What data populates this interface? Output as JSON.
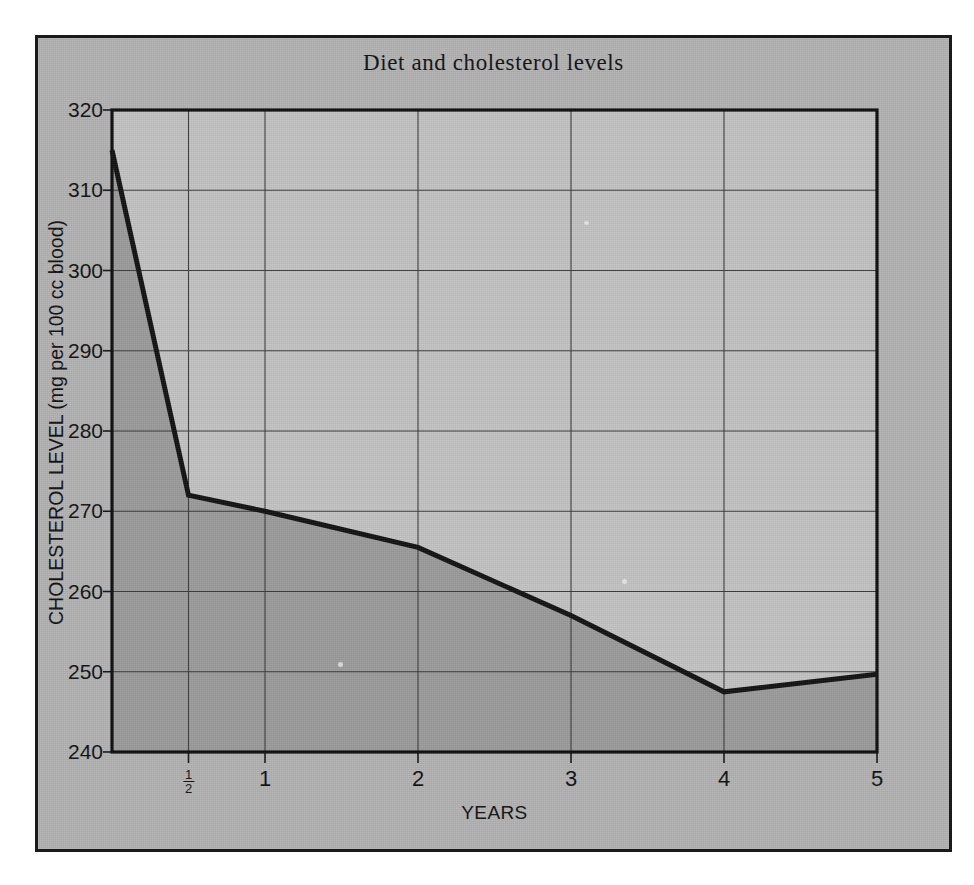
{
  "figure": {
    "title": "Diet and cholesterol levels",
    "panel_color": "#b2b2b2",
    "border_color": "#1a1a1a",
    "fill_below_color": "#9b9b9b",
    "fill_above_color": "#c3c3c3",
    "line_color": "#121212",
    "grid_color": "#3b3b3b"
  },
  "chart_data": {
    "type": "line",
    "title": "Diet and cholesterol levels",
    "xlabel": "YEARS",
    "ylabel": "CHOLESTEROL LEVEL (mg per 100 cc blood)",
    "xlim": [
      0,
      5
    ],
    "ylim": [
      240,
      320
    ],
    "grid": true,
    "legend": "none",
    "filled_area": true,
    "x_tick_values": [
      0.5,
      1,
      2,
      3,
      4,
      5
    ],
    "x_tick_labels": [
      "1/2",
      "1",
      "2",
      "3",
      "4",
      "5"
    ],
    "y_tick_values": [
      240,
      250,
      260,
      270,
      280,
      290,
      300,
      310,
      320
    ],
    "y_tick_labels": [
      "240",
      "250",
      "260",
      "270",
      "280",
      "290",
      "300",
      "310",
      "320"
    ],
    "series": [
      {
        "name": "Cholesterol level",
        "x": [
          0,
          0.5,
          1,
          2,
          3,
          4,
          5
        ],
        "values": [
          315,
          272,
          270,
          265.5,
          257,
          247.5,
          249.7
        ]
      }
    ]
  },
  "x_ticks": [
    {
      "label": "1/2",
      "numerator": "1",
      "denominator": "2",
      "value": 0.5,
      "fraction": true
    },
    {
      "label": "1",
      "value": 1,
      "fraction": false
    },
    {
      "label": "2",
      "value": 2,
      "fraction": false
    },
    {
      "label": "3",
      "value": 3,
      "fraction": false
    },
    {
      "label": "4",
      "value": 4,
      "fraction": false
    },
    {
      "label": "5",
      "value": 5,
      "fraction": false
    }
  ],
  "y_ticks": [
    {
      "label": "320",
      "value": 320
    },
    {
      "label": "310",
      "value": 310
    },
    {
      "label": "300",
      "value": 300
    },
    {
      "label": "290",
      "value": 290
    },
    {
      "label": "280",
      "value": 280
    },
    {
      "label": "270",
      "value": 270
    },
    {
      "label": "260",
      "value": 260
    },
    {
      "label": "250",
      "value": 250
    },
    {
      "label": "240",
      "value": 240
    }
  ],
  "axis_titles": {
    "x": "YEARS",
    "y": "CHOLESTEROL LEVEL (mg per 100 cc blood)"
  }
}
